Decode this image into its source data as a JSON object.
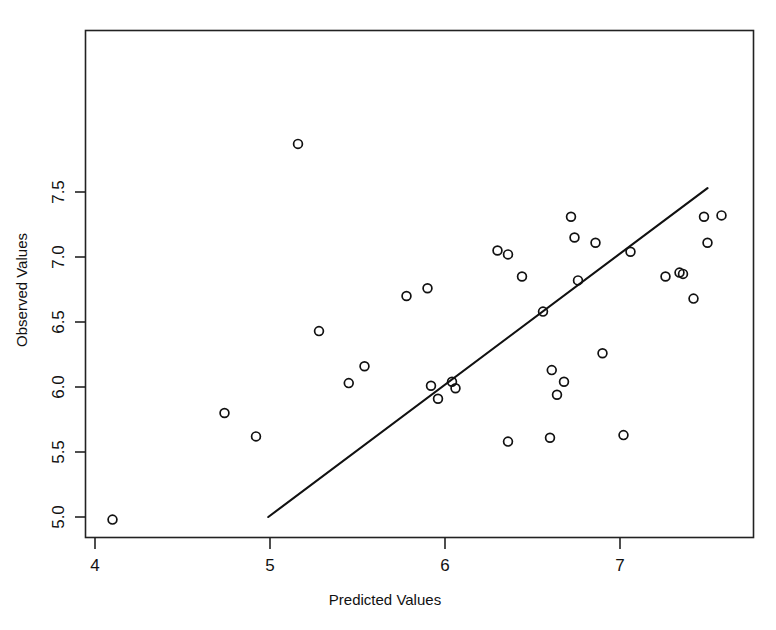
{
  "chart_data": {
    "type": "scatter",
    "title": "",
    "xlabel": "Predicted Values",
    "ylabel": "Observed Values",
    "xlim": [
      3.94,
      7.76
    ],
    "ylim": [
      4.86,
      7.95
    ],
    "grid": false,
    "legend": null,
    "x_ticks": [
      4,
      5,
      6,
      7
    ],
    "x_tick_labels": [
      "4",
      "5",
      "6",
      "7"
    ],
    "y_ticks": [
      5.0,
      5.5,
      6.0,
      6.5,
      7.0,
      7.5
    ],
    "y_tick_labels": [
      "5.0",
      "5.5",
      "6.0",
      "6.5",
      "7.0",
      "7.5"
    ],
    "marker": "open-circle",
    "marker_color": "#111111",
    "points": [
      {
        "x": 4.1,
        "y": 4.98
      },
      {
        "x": 4.74,
        "y": 5.8
      },
      {
        "x": 4.92,
        "y": 5.62
      },
      {
        "x": 5.16,
        "y": 7.87
      },
      {
        "x": 5.28,
        "y": 6.43
      },
      {
        "x": 5.45,
        "y": 6.03
      },
      {
        "x": 5.54,
        "y": 6.16
      },
      {
        "x": 5.78,
        "y": 6.7
      },
      {
        "x": 5.9,
        "y": 6.76
      },
      {
        "x": 5.92,
        "y": 6.01
      },
      {
        "x": 5.96,
        "y": 5.91
      },
      {
        "x": 6.04,
        "y": 6.04
      },
      {
        "x": 6.06,
        "y": 5.99
      },
      {
        "x": 6.3,
        "y": 7.05
      },
      {
        "x": 6.36,
        "y": 7.02
      },
      {
        "x": 6.36,
        "y": 5.58
      },
      {
        "x": 6.44,
        "y": 6.85
      },
      {
        "x": 6.56,
        "y": 6.58
      },
      {
        "x": 6.6,
        "y": 5.61
      },
      {
        "x": 6.61,
        "y": 6.13
      },
      {
        "x": 6.64,
        "y": 5.94
      },
      {
        "x": 6.68,
        "y": 6.04
      },
      {
        "x": 6.72,
        "y": 7.31
      },
      {
        "x": 6.74,
        "y": 7.15
      },
      {
        "x": 6.76,
        "y": 6.82
      },
      {
        "x": 6.86,
        "y": 7.11
      },
      {
        "x": 6.9,
        "y": 6.26
      },
      {
        "x": 7.02,
        "y": 5.63
      },
      {
        "x": 7.06,
        "y": 7.04
      },
      {
        "x": 7.26,
        "y": 6.85
      },
      {
        "x": 7.34,
        "y": 6.88
      },
      {
        "x": 7.36,
        "y": 6.87
      },
      {
        "x": 7.42,
        "y": 6.68
      },
      {
        "x": 7.48,
        "y": 7.31
      },
      {
        "x": 7.5,
        "y": 7.11
      },
      {
        "x": 7.58,
        "y": 7.32
      }
    ],
    "reference_line": {
      "label": "identity-line",
      "x0": 4.99,
      "y0": 5.0,
      "x1": 7.5,
      "y1": 7.53
    }
  }
}
